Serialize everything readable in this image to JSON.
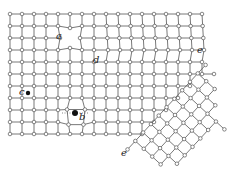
{
  "figure": {
    "labels": {
      "a": "a",
      "b": "b",
      "c": "c",
      "d": "d",
      "e_top": "e",
      "e_bottom": "e"
    },
    "defects": [
      {
        "label": "a",
        "type": "vacancy"
      },
      {
        "label": "b",
        "type": "interstitial"
      },
      {
        "label": "c",
        "type": "substitutional impurity"
      },
      {
        "label": "d",
        "type": "edge dislocation"
      },
      {
        "label": "e",
        "type": "grain boundary"
      }
    ],
    "colors": {
      "line": "#555555",
      "atom_fill": "#ffffff",
      "atom_stroke": "#555555",
      "impurity": "#111111"
    },
    "grid": {
      "origin_x": 10,
      "origin_y": 14,
      "spacing": 12,
      "cols": 19,
      "rows": 11
    }
  }
}
